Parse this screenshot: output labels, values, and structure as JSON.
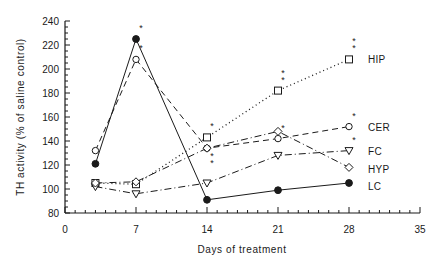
{
  "chart_data": {
    "type": "line",
    "title": "",
    "xlabel": "Days of treatment",
    "ylabel": "TH activity (% of saline control)",
    "xlim": [
      0,
      35
    ],
    "ylim": [
      80,
      240
    ],
    "xticks": [
      0,
      7,
      14,
      21,
      28,
      35
    ],
    "yticks": [
      80,
      100,
      120,
      140,
      160,
      180,
      200,
      220,
      240
    ],
    "grid": false,
    "legend_position": "right, inline labels at series ends",
    "x": [
      3,
      7,
      14,
      21,
      28
    ],
    "series": [
      {
        "name": "HIP",
        "marker": "square",
        "line": "dotted",
        "values": [
          105,
          104,
          143,
          182,
          208
        ],
        "significance": [
          null,
          null,
          "*",
          "**",
          "**"
        ]
      },
      {
        "name": "CER",
        "marker": "open-circle",
        "line": "dashed",
        "values": [
          132,
          208,
          134,
          142,
          152
        ],
        "significance": [
          null,
          "*",
          "**",
          "*",
          "*"
        ]
      },
      {
        "name": "FC",
        "marker": "down-triangle",
        "line": "dash-dot",
        "values": [
          102,
          96,
          105,
          128,
          132
        ],
        "significance": [
          null,
          null,
          null,
          null,
          "*"
        ]
      },
      {
        "name": "HYP",
        "marker": "diamond",
        "line": "dash-dot",
        "values": [
          105,
          106,
          134,
          148,
          118
        ],
        "significance": [
          null,
          null,
          null,
          null,
          null
        ]
      },
      {
        "name": "LC",
        "marker": "filled-circle",
        "line": "solid",
        "values": [
          121,
          225,
          91,
          99,
          105
        ],
        "significance": [
          null,
          "*",
          null,
          null,
          null
        ]
      }
    ]
  }
}
